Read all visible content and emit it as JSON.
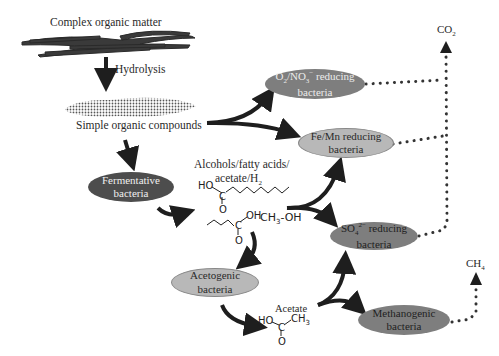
{
  "stages": {
    "complex": "Complex organic matter",
    "hydrolysis": "Hydrolysis",
    "simple": "Simple organic compounds",
    "intermediates_line1": "Alcohols/fatty acids/",
    "intermediates_line2": "acetate/H",
    "intermediates_line2_sub": "2",
    "methanol": "CH",
    "methanol_sub": "3",
    "methanol_tail": "-OH",
    "acetate": "Acetate"
  },
  "nodes": {
    "o2no3": {
      "line1_a": "O",
      "line1_sub1": "2",
      "line1_b": "/NO",
      "line1_sub2": "3",
      "line1_sup": "−",
      "line1_c": " reducing",
      "line2": "bacteria"
    },
    "femn": {
      "line1": "Fe/Mn reducing",
      "line2": "bacteria"
    },
    "fermentative": {
      "line1": "Fermentative",
      "line2": "bacteria"
    },
    "so4": {
      "line1_a": "SO",
      "line1_sub": "4",
      "line1_sup": "2−",
      "line1_c": " reducing",
      "line2": "bacteria"
    },
    "acetogenic": {
      "line1": "Acetogenic",
      "line2": "bacteria"
    },
    "methanogenic": {
      "line1": "Methanogenic",
      "line2": "bacteria"
    }
  },
  "products": {
    "co2": "CO",
    "co2_sub": "2",
    "ch4": "CH",
    "ch4_sub": "4"
  },
  "chem": {
    "ho": "HO",
    "c": "C",
    "o": "O",
    "oh": "OH",
    "ch3": "CH",
    "ch3_sub": "3"
  },
  "colors": {
    "dark_node": "#4d4d4d",
    "mid_node": "#7e7e7e",
    "light_node": "#b8b8b8",
    "arrow": "#1e1e1e",
    "dots": "#333333"
  }
}
